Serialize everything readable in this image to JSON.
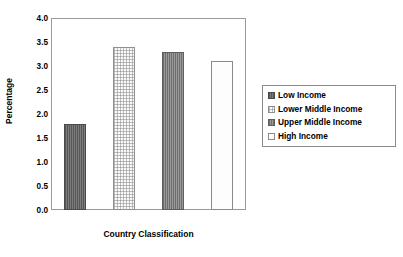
{
  "chart_data": {
    "type": "bar",
    "title": "",
    "xlabel": "Country Classification",
    "ylabel": "Percentage",
    "categories": [
      "Low Income",
      "Lower Middle Income",
      "Upper Middle Income",
      "High Income"
    ],
    "values": [
      1.8,
      3.4,
      3.3,
      3.1
    ],
    "ylim": [
      0.0,
      4.0
    ],
    "ytick_labels": [
      "4.0",
      "3.5",
      "3.0",
      "2.5",
      "2.0",
      "1.5",
      "1.0",
      "0.5",
      "0.0"
    ],
    "ytick_values": [
      4.0,
      3.5,
      3.0,
      2.5,
      2.0,
      1.5,
      1.0,
      0.5,
      0.0
    ],
    "xtick_labels": [],
    "grid": false,
    "legend_position": "right",
    "series": [
      {
        "name": "Low Income",
        "value": 1.8,
        "fill": "dark-gray-vertical-stripe",
        "color": "#6e6e6e"
      },
      {
        "name": "Lower Middle Income",
        "value": 3.4,
        "fill": "light-dotted",
        "color": "#fafafa"
      },
      {
        "name": "Upper Middle Income",
        "value": 3.3,
        "fill": "medium-gray-vertical-stripe",
        "color": "#888888"
      },
      {
        "name": "High Income",
        "value": 3.1,
        "fill": "white-solid",
        "color": "#fdfdfd"
      }
    ]
  },
  "axes": {
    "y_title": "Percentage",
    "x_title": "Country Classification"
  },
  "legend": {
    "items": [
      {
        "label": "Low Income"
      },
      {
        "label": "Lower Middle Income"
      },
      {
        "label": "Upper Middle Income"
      },
      {
        "label": "High Income"
      }
    ]
  },
  "colors": {
    "frame": "#9a9a9a",
    "text": "#000000",
    "background": "#ffffff"
  }
}
